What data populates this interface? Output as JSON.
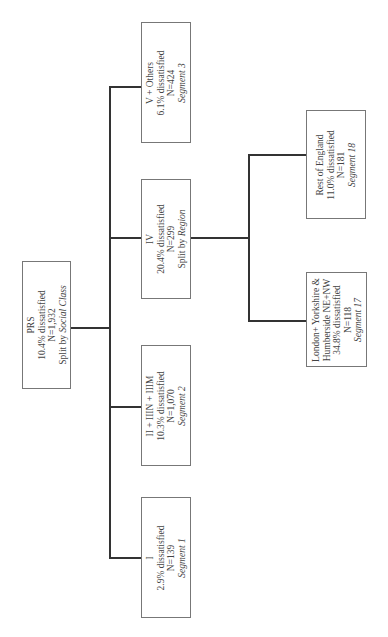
{
  "root": {
    "title": "PRS",
    "dissatisfied": "10.4% dissatisfied",
    "n": "N=1,932",
    "split_prefix": "Split by ",
    "split_var": "Social Class"
  },
  "nodes": [
    {
      "title": "V + Others",
      "dissatisfied": "6.1% dissatisfied",
      "n": "N=424",
      "segment": "Segment 3"
    },
    {
      "title": "IV",
      "dissatisfied": "20.4% dissatisfied",
      "n": "N=299",
      "split_prefix": "Split by ",
      "split_var": "Region"
    },
    {
      "title": "II + IIIN + IIIM",
      "dissatisfied": "10.3% dissatisfied",
      "n": "N=1,070",
      "segment": "Segment 2"
    },
    {
      "title": "I",
      "dissatisfied": "2.9% dissatisfied",
      "n": "N=139",
      "segment": "Segment 1"
    }
  ],
  "region_nodes": [
    {
      "title": "Rest of England",
      "dissatisfied": "11.0% dissatisfied",
      "n": "N=181",
      "segment": "Segment 18"
    },
    {
      "title_line1": "London+ Yorkshire &",
      "title_line2": "Humberside NE+NW",
      "dissatisfied": "34.8% dissatisfied",
      "n": "N=118",
      "segment": "Segment 17"
    }
  ]
}
